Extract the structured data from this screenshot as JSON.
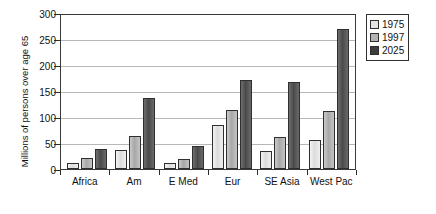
{
  "chart_data": {
    "type": "bar",
    "title": "",
    "xlabel": "",
    "ylabel": "Millions of persons over age 65",
    "categories": [
      "Africa",
      "Am",
      "E Med",
      "Eur",
      "SE Asia",
      "West Pac"
    ],
    "series": [
      {
        "name": "1975",
        "color": "#e4e4e4",
        "values": [
          12,
          37,
          11,
          84,
          35,
          56
        ]
      },
      {
        "name": "1997",
        "color": "#b4b4b4",
        "values": [
          22,
          63,
          19,
          113,
          62,
          112
        ]
      },
      {
        "name": "2025",
        "color": "#3d3d3d",
        "values": [
          38,
          136,
          44,
          171,
          167,
          269
        ]
      }
    ],
    "ylim": [
      0,
      300
    ],
    "yticks": [
      0,
      50,
      100,
      150,
      200,
      250,
      300
    ],
    "ytick_labels": [
      "0",
      "50",
      "100",
      "150",
      "200",
      "250",
      "300"
    ],
    "grid": true,
    "legend_position": "right-top",
    "legend_entries": [
      "1975",
      "1997",
      "2025"
    ]
  }
}
